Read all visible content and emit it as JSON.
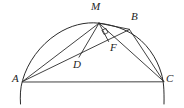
{
  "figure": {
    "type": "geometry-diagram",
    "stroke_color": "#2b2b2b",
    "label_color": "#242424",
    "background_color": "#ffffff",
    "width": 184,
    "height": 108
  },
  "labels": {
    "M": "M",
    "B": "B",
    "F": "F",
    "D": "D",
    "A": "A",
    "C": "C"
  },
  "label_positions": {
    "M": {
      "x": 91,
      "y": 2
    },
    "B": {
      "x": 131,
      "y": 12
    },
    "F": {
      "x": 110,
      "y": 43
    },
    "D": {
      "x": 73,
      "y": 60
    },
    "A": {
      "x": 12,
      "y": 74
    },
    "C": {
      "x": 166,
      "y": 74
    }
  },
  "points": {
    "A": {
      "x": 22,
      "y": 82
    },
    "C": {
      "x": 164,
      "y": 82
    },
    "M": {
      "x": 99,
      "y": 23
    },
    "B": {
      "x": 129,
      "y": 29
    },
    "D": {
      "x": 79,
      "y": 57
    },
    "F": {
      "x": 108,
      "y": 40
    }
  },
  "arc": {
    "center_x": 93,
    "center_y": 82,
    "radius_x": 71,
    "radius_y": 59,
    "start_angle_deg": 186,
    "end_angle_deg": 354
  },
  "segments": [
    {
      "name": "chord-AM",
      "from": "A",
      "to": "M"
    },
    {
      "name": "chord-AB",
      "from": "A",
      "to": "B"
    },
    {
      "name": "chord-AC",
      "from": "A",
      "to": "C"
    },
    {
      "name": "chord-MD",
      "from": "M",
      "to": "D"
    },
    {
      "name": "chord-MF",
      "from": "M",
      "to": "F"
    },
    {
      "name": "chord-MC",
      "from": "M",
      "to": "C"
    },
    {
      "name": "chord-MB",
      "from": "M",
      "to": "B"
    },
    {
      "name": "chord-BC",
      "from": "B",
      "to": "C"
    }
  ],
  "right_angle": {
    "at": "F",
    "marker": "square",
    "between": [
      "MF",
      "AB"
    ]
  }
}
